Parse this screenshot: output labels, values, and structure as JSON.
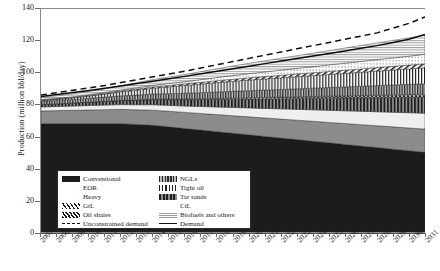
{
  "chart_data": {
    "type": "area",
    "title": "",
    "xlabel": "",
    "ylabel": "Production (million bbl/day)",
    "ylim": [
      0,
      140
    ],
    "yticks": [
      0,
      20,
      40,
      60,
      80,
      100,
      120,
      140
    ],
    "grid": false,
    "legend_position": "lower-left-inside",
    "x": [
      2007,
      2008,
      2009,
      2010,
      2011,
      2012,
      2013,
      2014,
      2015,
      2016,
      2017,
      2018,
      2019,
      2020,
      2021,
      2022,
      2023,
      2024,
      2025,
      2026,
      2027,
      2028,
      2029,
      2030,
      2031
    ],
    "xtick_labels": [
      "2007",
      "2008",
      "2009",
      "2010",
      "2011",
      "2012",
      "2013",
      "2014",
      "2015",
      "2016",
      "2017",
      "2018",
      "2019",
      "2020",
      "2021",
      "2022",
      "2023",
      "2024",
      "2025",
      "2026",
      "2027",
      "2028",
      "2029",
      "2030",
      "2031"
    ],
    "stack_order": [
      "Conventional",
      "Heavy",
      "EOR",
      "Tar sands",
      "Oil shales",
      "NGLs",
      "Tight oil",
      "GtL",
      "CtL",
      "Biofuels and others"
    ],
    "series": [
      {
        "name": "Conventional",
        "values": [
          68,
          68,
          68,
          68,
          68,
          68,
          67.5,
          67,
          66,
          65,
          64,
          63,
          62,
          61,
          60,
          59,
          58,
          57,
          56,
          55,
          54,
          53,
          52,
          51,
          50
        ]
      },
      {
        "name": "Heavy",
        "values": [
          8,
          8.2,
          8.4,
          8.6,
          8.8,
          9,
          9.2,
          9.5,
          9.8,
          10.1,
          10.4,
          10.7,
          11,
          11.3,
          11.6,
          11.9,
          12.2,
          12.5,
          12.8,
          13.1,
          13.4,
          13.7,
          14,
          14.3,
          14.6
        ]
      },
      {
        "name": "EOR",
        "values": [
          2.5,
          2.6,
          2.7,
          2.8,
          2.9,
          3,
          3.2,
          3.4,
          3.7,
          4,
          4.4,
          4.8,
          5.2,
          5.6,
          6,
          6.4,
          6.8,
          7.2,
          7.6,
          8,
          8.4,
          8.8,
          9.2,
          9.6,
          10
        ]
      },
      {
        "name": "Tar sands",
        "values": [
          1.5,
          1.6,
          1.8,
          2,
          2.2,
          2.5,
          2.8,
          3.2,
          3.6,
          4,
          4.4,
          4.8,
          5.2,
          5.6,
          6,
          6.4,
          6.8,
          7.2,
          7.6,
          8,
          8.4,
          8.8,
          9.2,
          9.6,
          10
        ]
      },
      {
        "name": "Oil shales",
        "values": [
          0.1,
          0.1,
          0.12,
          0.15,
          0.18,
          0.2,
          0.25,
          0.3,
          0.35,
          0.4,
          0.5,
          0.6,
          0.7,
          0.8,
          0.9,
          1,
          1.1,
          1.2,
          1.3,
          1.4,
          1.5,
          1.6,
          1.7,
          1.8,
          1.9
        ]
      },
      {
        "name": "NGLs",
        "values": [
          2,
          2.1,
          2.2,
          2.4,
          2.6,
          2.8,
          3,
          3.2,
          3.4,
          3.6,
          3.8,
          4,
          4.2,
          4.4,
          4.6,
          4.8,
          5,
          5.2,
          5.4,
          5.6,
          5.8,
          6,
          6.2,
          6.4,
          6.6
        ]
      },
      {
        "name": "Tight oil",
        "values": [
          0.5,
          0.7,
          1,
          1.4,
          1.9,
          2.5,
          3.1,
          3.7,
          4.3,
          4.9,
          5.4,
          5.9,
          6.3,
          6.7,
          7,
          7.3,
          7.6,
          7.9,
          8.2,
          8.5,
          8.8,
          9.1,
          9.4,
          9.7,
          10
        ]
      },
      {
        "name": "GtL",
        "values": [
          0.3,
          0.35,
          0.4,
          0.45,
          0.5,
          0.6,
          0.7,
          0.8,
          0.9,
          1,
          1.1,
          1.2,
          1.3,
          1.4,
          1.5,
          1.6,
          1.7,
          1.8,
          1.9,
          2,
          2.1,
          2.2,
          2.3,
          2.4,
          2.5
        ]
      },
      {
        "name": "CtL",
        "values": [
          0.2,
          0.25,
          0.3,
          0.4,
          0.5,
          0.6,
          0.8,
          1,
          1.2,
          1.4,
          1.7,
          2,
          2.3,
          2.6,
          2.9,
          3.2,
          3.5,
          3.8,
          4.1,
          4.4,
          4.7,
          5,
          5.3,
          5.6,
          6
        ]
      },
      {
        "name": "Biofuels and others",
        "values": [
          1.4,
          1.6,
          1.8,
          2.1,
          2.4,
          2.8,
          3.2,
          3.6,
          4,
          4.5,
          5,
          5.5,
          6,
          6.5,
          7,
          7.5,
          8,
          8.5,
          9,
          9.5,
          10,
          10.5,
          11,
          11.5,
          12
        ]
      }
    ],
    "lines": [
      {
        "name": "Unconstrained demand",
        "style": "dashed",
        "values": [
          86,
          87.5,
          89,
          90.5,
          92,
          93.8,
          95.6,
          97.4,
          99.2,
          101,
          103,
          105,
          107,
          109,
          111,
          113,
          115,
          117,
          119,
          121,
          123,
          125,
          128,
          131,
          135
        ]
      },
      {
        "name": "Demand",
        "style": "solid",
        "values": [
          85,
          86.3,
          87.6,
          88.9,
          90.2,
          91.7,
          93.2,
          94.7,
          96.2,
          97.7,
          99.3,
          100.9,
          102.5,
          104.1,
          105.7,
          107.3,
          108.9,
          110.5,
          112.1,
          113.7,
          115.3,
          117,
          119,
          121,
          124
        ]
      }
    ]
  },
  "legend": {
    "left_column": [
      {
        "label": "Conventional",
        "swatch": "solid-dark"
      },
      {
        "label": "EOR",
        "swatch": "white"
      },
      {
        "label": "Heavy",
        "swatch": "white"
      },
      {
        "label": "GtL",
        "swatch": "diagonal-hatch"
      },
      {
        "label": "Oil shales",
        "swatch": "cross-hatch"
      },
      {
        "label": "Unconstrained demand",
        "swatch": "dashed-line"
      }
    ],
    "right_column": [
      {
        "label": "NGLs",
        "swatch": "vertical-dense"
      },
      {
        "label": "Tight oil",
        "swatch": "vertical-stripe"
      },
      {
        "label": "Tar sands",
        "swatch": "vertical-wide"
      },
      {
        "label": "CtL",
        "swatch": "dotted"
      },
      {
        "label": "Biofuels and others",
        "swatch": "horizontal-stripe"
      },
      {
        "label": "Demand",
        "swatch": "solid-line"
      }
    ]
  },
  "colors": {
    "conventional": "#1c1c1c",
    "heavy": "#8c8c8c",
    "eor": "#e8e8e8",
    "axis": "#4a4a4a",
    "background": "#ffffff"
  }
}
